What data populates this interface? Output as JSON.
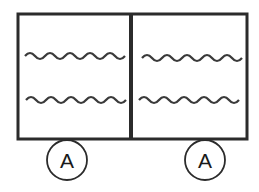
{
  "diagram": {
    "colors": {
      "stroke": "#2b2b2b",
      "background": "#ffffff"
    },
    "panels": [
      {
        "id": "left",
        "wavy_lines": 2,
        "label": "A"
      },
      {
        "id": "right",
        "wavy_lines": 2,
        "label": "A"
      }
    ]
  }
}
